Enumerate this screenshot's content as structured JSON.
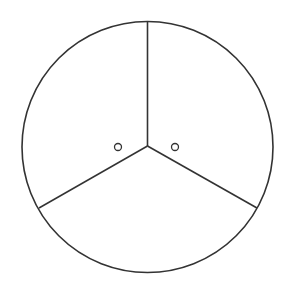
{
  "diagram": {
    "type": "circle-divided-into-three-sectors",
    "stroke_color": "#333333",
    "background": "#ffffff",
    "circle": {
      "cx": 147.5,
      "cy": 147,
      "r": 125.5
    },
    "hub": {
      "x": 147.5,
      "y": 146
    },
    "radials": [
      {
        "name": "top",
        "x": 147.5,
        "y": 21.5
      },
      {
        "name": "lower-left",
        "x": 39,
        "y": 208
      },
      {
        "name": "lower-right",
        "x": 257,
        "y": 208
      }
    ],
    "markers": [
      {
        "name": "left-marker",
        "cx": 118,
        "cy": 147,
        "r": 3.5
      },
      {
        "name": "right-marker",
        "cx": 175,
        "cy": 147,
        "r": 3.5
      }
    ]
  }
}
